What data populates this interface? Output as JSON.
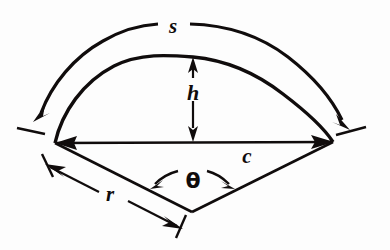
{
  "figure": {
    "background_color": "#fdfdfd",
    "ink_color": "#100c0c",
    "labels": {
      "arc_length": "s",
      "height": "h",
      "chord": "c",
      "radius": "r",
      "angle": "θ"
    },
    "elements": {
      "outer_arc_name": "arc-length-s",
      "inner_arc_name": "segment-arc",
      "chord_name": "chord-c",
      "height_name": "height-h",
      "radius_left_name": "radius-left",
      "radius_right_name": "radius-right",
      "angle_name": "central-angle-theta"
    },
    "geometry": {
      "apex": {
        "x": 192,
        "y": 212
      },
      "chord_left": {
        "x": 55,
        "y": 143
      },
      "chord_right": {
        "x": 333,
        "y": 142
      },
      "arc_apex": {
        "x": 193,
        "y": 57
      },
      "radius_px": 155,
      "central_angle_deg": 127
    }
  }
}
